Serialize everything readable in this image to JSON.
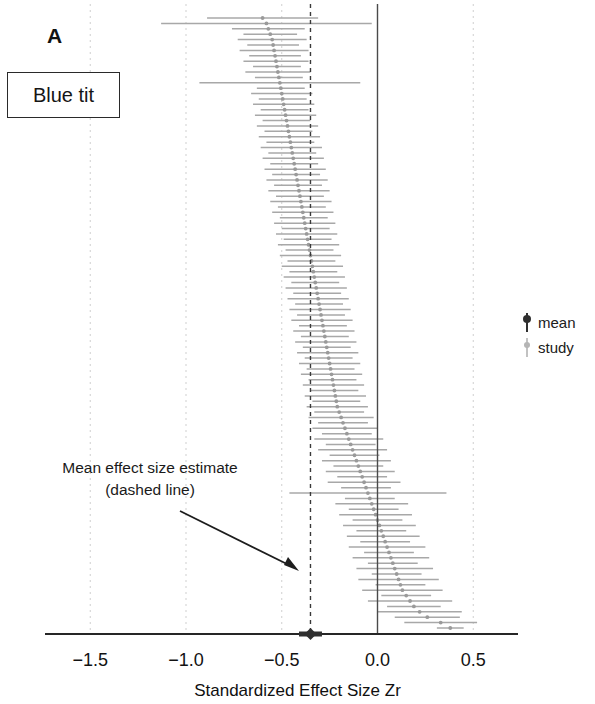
{
  "figure": {
    "panel_letter": "A",
    "species_label": "Blue tit",
    "annotation_line1": "Mean effect size estimate",
    "annotation_line2": "(dashed line)"
  },
  "legend": {
    "position": "right",
    "entries": [
      {
        "label": "mean",
        "marker": "diamond-with-line",
        "color": "#3b3b3b"
      },
      {
        "label": "study",
        "marker": "point-with-line",
        "color": "#b3b3b3"
      }
    ]
  },
  "colors": {
    "study": "#a8a8a8",
    "mean": "#2f2f2f",
    "grid": "#cfcfcf",
    "axis": "#262626",
    "zero_line": "#4a4a4a",
    "dashed_mean_line": "#3a3a3a",
    "text": "#151515"
  },
  "chart_data": {
    "type": "scatter",
    "subtype": "forest-plot",
    "title": "Blue tit",
    "xlabel": "Standardized Effect Size Zr",
    "ylabel": "",
    "xlim": [
      -1.72,
      0.74
    ],
    "ylim": [
      0,
      112
    ],
    "grid": true,
    "grid_axis": "x",
    "legend_position": "right",
    "xticks": [
      -1.5,
      -1.0,
      -0.5,
      0.0,
      0.5
    ],
    "xticklabels": [
      "−1.5",
      "−1.0",
      "−0.5",
      "0.0",
      "0.5"
    ],
    "reference_lines": [
      {
        "name": "zero-line",
        "x": 0.0,
        "style": "solid",
        "color": "#4a4a4a"
      },
      {
        "name": "mean-effect-line",
        "x": -0.35,
        "style": "dashed",
        "color": "#3a3a3a"
      }
    ],
    "mean_estimate": {
      "zr": -0.35,
      "ci_lower": -0.41,
      "ci_upper": -0.29,
      "marker": "diamond"
    },
    "series": [
      {
        "name": "study",
        "type": "interval",
        "note": "Each row is one study effect size with 95% confidence interval, sorted ascending by Zr from top to bottom.",
        "points": [
          {
            "zr": -0.6,
            "lo": -0.89,
            "hi": -0.31
          },
          {
            "zr": -0.58,
            "lo": -1.13,
            "hi": -0.03
          },
          {
            "zr": -0.57,
            "lo": -0.76,
            "hi": -0.38
          },
          {
            "zr": -0.56,
            "lo": -0.7,
            "hi": -0.42
          },
          {
            "zr": -0.55,
            "lo": -0.73,
            "hi": -0.37
          },
          {
            "zr": -0.545,
            "lo": -0.68,
            "hi": -0.41
          },
          {
            "zr": -0.54,
            "lo": -0.72,
            "hi": -0.36
          },
          {
            "zr": -0.535,
            "lo": -0.67,
            "hi": -0.4
          },
          {
            "zr": -0.53,
            "lo": -0.7,
            "hi": -0.36
          },
          {
            "zr": -0.525,
            "lo": -0.65,
            "hi": -0.4
          },
          {
            "zr": -0.52,
            "lo": -0.69,
            "hi": -0.35
          },
          {
            "zr": -0.515,
            "lo": -0.64,
            "hi": -0.39
          },
          {
            "zr": -0.51,
            "lo": -0.93,
            "hi": -0.09
          },
          {
            "zr": -0.505,
            "lo": -0.63,
            "hi": -0.38
          },
          {
            "zr": -0.5,
            "lo": -0.66,
            "hi": -0.34
          },
          {
            "zr": -0.495,
            "lo": -0.62,
            "hi": -0.37
          },
          {
            "zr": -0.49,
            "lo": -0.65,
            "hi": -0.33
          },
          {
            "zr": -0.485,
            "lo": -0.61,
            "hi": -0.36
          },
          {
            "zr": -0.48,
            "lo": -0.64,
            "hi": -0.32
          },
          {
            "zr": -0.475,
            "lo": -0.6,
            "hi": -0.35
          },
          {
            "zr": -0.47,
            "lo": -0.63,
            "hi": -0.31
          },
          {
            "zr": -0.465,
            "lo": -0.59,
            "hi": -0.34
          },
          {
            "zr": -0.46,
            "lo": -0.62,
            "hi": -0.3
          },
          {
            "zr": -0.455,
            "lo": -0.58,
            "hi": -0.33
          },
          {
            "zr": -0.45,
            "lo": -0.61,
            "hi": -0.29
          },
          {
            "zr": -0.445,
            "lo": -0.57,
            "hi": -0.32
          },
          {
            "zr": -0.44,
            "lo": -0.6,
            "hi": -0.28
          },
          {
            "zr": -0.435,
            "lo": -0.56,
            "hi": -0.31
          },
          {
            "zr": -0.43,
            "lo": -0.59,
            "hi": -0.27
          },
          {
            "zr": -0.425,
            "lo": -0.55,
            "hi": -0.3
          },
          {
            "zr": -0.42,
            "lo": -0.58,
            "hi": -0.26
          },
          {
            "zr": -0.415,
            "lo": -0.54,
            "hi": -0.29
          },
          {
            "zr": -0.41,
            "lo": -0.57,
            "hi": -0.25
          },
          {
            "zr": -0.405,
            "lo": -0.53,
            "hi": -0.28
          },
          {
            "zr": -0.4,
            "lo": -0.56,
            "hi": -0.24
          },
          {
            "zr": -0.395,
            "lo": -0.52,
            "hi": -0.27
          },
          {
            "zr": -0.39,
            "lo": -0.55,
            "hi": -0.23
          },
          {
            "zr": -0.385,
            "lo": -0.51,
            "hi": -0.26
          },
          {
            "zr": -0.38,
            "lo": -0.54,
            "hi": -0.22
          },
          {
            "zr": -0.375,
            "lo": -0.5,
            "hi": -0.25
          },
          {
            "zr": -0.37,
            "lo": -0.53,
            "hi": -0.21
          },
          {
            "zr": -0.365,
            "lo": -0.49,
            "hi": -0.24
          },
          {
            "zr": -0.36,
            "lo": -0.52,
            "hi": -0.2
          },
          {
            "zr": -0.355,
            "lo": -0.48,
            "hi": -0.23
          },
          {
            "zr": -0.35,
            "lo": -0.51,
            "hi": -0.19
          },
          {
            "zr": -0.345,
            "lo": -0.47,
            "hi": -0.22
          },
          {
            "zr": -0.34,
            "lo": -0.5,
            "hi": -0.18
          },
          {
            "zr": -0.335,
            "lo": -0.46,
            "hi": -0.21
          },
          {
            "zr": -0.33,
            "lo": -0.49,
            "hi": -0.17
          },
          {
            "zr": -0.325,
            "lo": -0.45,
            "hi": -0.2
          },
          {
            "zr": -0.32,
            "lo": -0.48,
            "hi": -0.16
          },
          {
            "zr": -0.315,
            "lo": -0.44,
            "hi": -0.19
          },
          {
            "zr": -0.31,
            "lo": -0.47,
            "hi": -0.15
          },
          {
            "zr": -0.305,
            "lo": -0.43,
            "hi": -0.18
          },
          {
            "zr": -0.3,
            "lo": -0.46,
            "hi": -0.14
          },
          {
            "zr": -0.295,
            "lo": -0.42,
            "hi": -0.17
          },
          {
            "zr": -0.29,
            "lo": -0.45,
            "hi": -0.13
          },
          {
            "zr": -0.285,
            "lo": -0.41,
            "hi": -0.16
          },
          {
            "zr": -0.28,
            "lo": -0.44,
            "hi": -0.12
          },
          {
            "zr": -0.275,
            "lo": -0.4,
            "hi": -0.15
          },
          {
            "zr": -0.27,
            "lo": -0.43,
            "hi": -0.11
          },
          {
            "zr": -0.265,
            "lo": -0.39,
            "hi": -0.14
          },
          {
            "zr": -0.26,
            "lo": -0.42,
            "hi": -0.1
          },
          {
            "zr": -0.255,
            "lo": -0.38,
            "hi": -0.13
          },
          {
            "zr": -0.25,
            "lo": -0.41,
            "hi": -0.09
          },
          {
            "zr": -0.245,
            "lo": -0.37,
            "hi": -0.12
          },
          {
            "zr": -0.24,
            "lo": -0.4,
            "hi": -0.08
          },
          {
            "zr": -0.235,
            "lo": -0.36,
            "hi": -0.11
          },
          {
            "zr": -0.23,
            "lo": -0.39,
            "hi": -0.07
          },
          {
            "zr": -0.225,
            "lo": -0.35,
            "hi": -0.1
          },
          {
            "zr": -0.22,
            "lo": -0.38,
            "hi": -0.06
          },
          {
            "zr": -0.215,
            "lo": -0.34,
            "hi": -0.09
          },
          {
            "zr": -0.21,
            "lo": -0.37,
            "hi": -0.05
          },
          {
            "zr": -0.2,
            "lo": -0.33,
            "hi": -0.07
          },
          {
            "zr": -0.19,
            "lo": -0.36,
            "hi": -0.02
          },
          {
            "zr": -0.18,
            "lo": -0.31,
            "hi": -0.05
          },
          {
            "zr": -0.17,
            "lo": -0.34,
            "hi": 0.0
          },
          {
            "zr": -0.16,
            "lo": -0.29,
            "hi": -0.03
          },
          {
            "zr": -0.15,
            "lo": -0.33,
            "hi": 0.03
          },
          {
            "zr": -0.14,
            "lo": -0.27,
            "hi": -0.01
          },
          {
            "zr": -0.13,
            "lo": -0.31,
            "hi": 0.05
          },
          {
            "zr": -0.12,
            "lo": -0.25,
            "hi": 0.01
          },
          {
            "zr": -0.11,
            "lo": -0.29,
            "hi": 0.07
          },
          {
            "zr": -0.1,
            "lo": -0.23,
            "hi": 0.03
          },
          {
            "zr": -0.09,
            "lo": -0.27,
            "hi": 0.09
          },
          {
            "zr": -0.08,
            "lo": -0.21,
            "hi": 0.05
          },
          {
            "zr": -0.07,
            "lo": -0.26,
            "hi": 0.12
          },
          {
            "zr": -0.06,
            "lo": -0.19,
            "hi": 0.07
          },
          {
            "zr": -0.05,
            "lo": -0.46,
            "hi": 0.36
          },
          {
            "zr": -0.04,
            "lo": -0.17,
            "hi": 0.09
          },
          {
            "zr": -0.03,
            "lo": -0.22,
            "hi": 0.16
          },
          {
            "zr": -0.02,
            "lo": -0.15,
            "hi": 0.11
          },
          {
            "zr": -0.01,
            "lo": -0.2,
            "hi": 0.18
          },
          {
            "zr": 0.0,
            "lo": -0.13,
            "hi": 0.13
          },
          {
            "zr": 0.01,
            "lo": -0.18,
            "hi": 0.2
          },
          {
            "zr": 0.02,
            "lo": -0.11,
            "hi": 0.15
          },
          {
            "zr": 0.03,
            "lo": -0.16,
            "hi": 0.22
          },
          {
            "zr": 0.04,
            "lo": -0.09,
            "hi": 0.17
          },
          {
            "zr": 0.05,
            "lo": -0.15,
            "hi": 0.25
          },
          {
            "zr": 0.06,
            "lo": -0.07,
            "hi": 0.19
          },
          {
            "zr": 0.07,
            "lo": -0.13,
            "hi": 0.27
          },
          {
            "zr": 0.08,
            "lo": -0.05,
            "hi": 0.21
          },
          {
            "zr": 0.09,
            "lo": -0.11,
            "hi": 0.29
          },
          {
            "zr": 0.1,
            "lo": -0.03,
            "hi": 0.23
          },
          {
            "zr": 0.11,
            "lo": -0.1,
            "hi": 0.32
          },
          {
            "zr": 0.12,
            "lo": -0.01,
            "hi": 0.25
          },
          {
            "zr": 0.13,
            "lo": -0.08,
            "hi": 0.34
          },
          {
            "zr": 0.15,
            "lo": 0.02,
            "hi": 0.28
          },
          {
            "zr": 0.17,
            "lo": -0.05,
            "hi": 0.39
          },
          {
            "zr": 0.19,
            "lo": 0.05,
            "hi": 0.33
          },
          {
            "zr": 0.22,
            "lo": 0.0,
            "hi": 0.44
          },
          {
            "zr": 0.26,
            "lo": 0.09,
            "hi": 0.43
          },
          {
            "zr": 0.33,
            "lo": 0.14,
            "hi": 0.52
          },
          {
            "zr": 0.38,
            "lo": 0.31,
            "hi": 0.45
          }
        ]
      }
    ]
  }
}
